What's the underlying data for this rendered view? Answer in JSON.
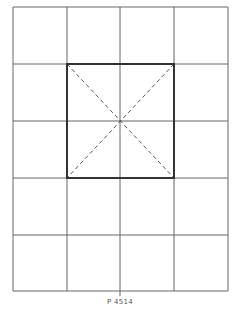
{
  "diagram": {
    "caption": "P 4514",
    "grid": {
      "columns": 4,
      "rows": 5,
      "x_lines": [
        13,
        67,
        120,
        174,
        228
      ],
      "y_lines": [
        7,
        64,
        121,
        178,
        235,
        291
      ],
      "line_color": "#555555"
    },
    "square": {
      "x": 67,
      "y": 64,
      "width": 107,
      "height": 114,
      "stroke_color": "#333333",
      "diagonals": "dashed"
    }
  }
}
